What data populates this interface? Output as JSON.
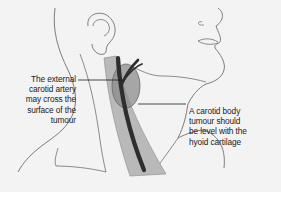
{
  "figure": {
    "annotations": [
      {
        "id": "external-carotid-note",
        "lines": [
          "The external",
          "carotid artery",
          "may cross the",
          "surface of the",
          "tumour"
        ]
      },
      {
        "id": "hyoid-level-note",
        "lines": [
          "A carotid body",
          "tumour should",
          "be level with the",
          "hyoid cartilage"
        ]
      }
    ],
    "colors": {
      "background": "#f3f3f3",
      "outline": "#6e6e6e",
      "artery": "#2e2e2e",
      "sternomastoid": "#b9b9b9",
      "tumour": "#8c8c8c"
    }
  }
}
